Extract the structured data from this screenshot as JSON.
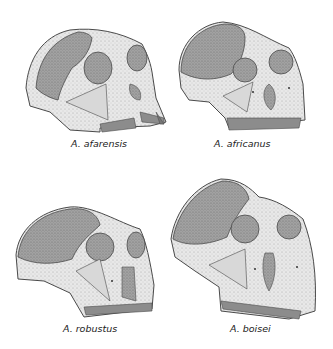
{
  "figure": {
    "colors": {
      "background": "#ffffff",
      "bone": "#e6e6e6",
      "braincase": "#9a9a9a",
      "orbit": "#a8a8a8",
      "teeth": "#8a8a8a",
      "outline": "#4a4a4a"
    },
    "panels": [
      {
        "id": "afarensis",
        "label": "A. afarensis",
        "position": "top-left"
      },
      {
        "id": "africanus",
        "label": "A. africanus",
        "position": "top-right"
      },
      {
        "id": "robustus",
        "label": "A. robustus",
        "position": "bottom-left"
      },
      {
        "id": "boisei",
        "label": "A. boisei",
        "position": "bottom-right"
      }
    ]
  }
}
